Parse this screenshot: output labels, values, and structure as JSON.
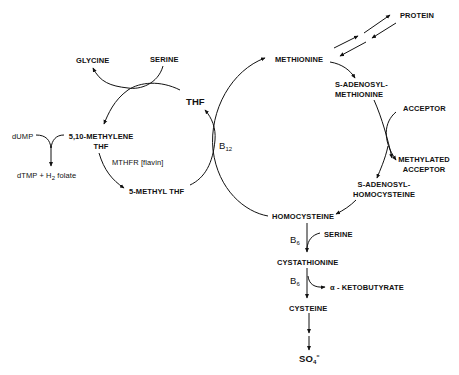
{
  "diagram": {
    "type": "metabolic-pathway",
    "title": "",
    "nodes": {
      "glycine": "GLYCINE",
      "serine_top": "SERINE",
      "thf": "THF",
      "methylene_thf_line1": "5,10-METHYLENE",
      "methylene_thf_line2": "THF",
      "dump": "dUMP",
      "dtmp": "dTMP + H",
      "dtmp_sub": "2",
      "dtmp_tail": " folate",
      "mthfr": "MTHFR [flavin]",
      "methyl_thf": "5-METHYL THF",
      "b12": "B",
      "b12_sub": "12",
      "methionine": "METHIONINE",
      "protein": "PROTEIN",
      "sam_line1": "S-ADENOSYL-",
      "sam_line2": "METHIONINE",
      "acceptor": "ACCEPTOR",
      "methylated_acceptor_line1": "METHYLATED",
      "methylated_acceptor_line2": "ACCEPTOR",
      "sah_line1": "S-ADENOSYL-",
      "sah_line2": "HOMOCYSTEINE",
      "homocysteine": "HOMOCYSTEINE",
      "b6_first": "B",
      "b6_first_sub": "6",
      "serine_bottom": "SERINE",
      "cystathionine": "CYSTATHIONINE",
      "b6_second": "B",
      "b6_second_sub": "6",
      "ketobutyrate": "α - KETOBUTYRATE",
      "cysteine": "CYSTEINE",
      "so4": "SO",
      "so4_sub": "4",
      "so4_sup": "="
    },
    "edges": [
      {
        "from": "SERINE",
        "to": "GLYCINE"
      },
      {
        "from": "THF",
        "to": "5,10-METHYLENE THF"
      },
      {
        "from": "5,10-METHYLENE THF",
        "to": "5-METHYL THF",
        "label": "MTHFR [flavin]"
      },
      {
        "from": "dUMP",
        "to": "dTMP + H2 folate"
      },
      {
        "from": "5-METHYL THF",
        "to": "THF",
        "cofactor": "B12"
      },
      {
        "from": "HOMOCYSTEINE",
        "to": "METHIONINE",
        "cofactor": "B12"
      },
      {
        "from": "METHIONINE",
        "to": "PROTEIN",
        "bidirectional": true
      },
      {
        "from": "METHIONINE",
        "to": "S-ADENOSYL-METHIONINE"
      },
      {
        "from": "S-ADENOSYL-METHIONINE",
        "to": "S-ADENOSYL-HOMOCYSTEINE"
      },
      {
        "from": "ACCEPTOR",
        "to": "METHYLATED ACCEPTOR"
      },
      {
        "from": "S-ADENOSYL-HOMOCYSTEINE",
        "to": "HOMOCYSTEINE"
      },
      {
        "from": "HOMOCYSTEINE",
        "to": "CYSTATHIONINE",
        "cofactor": "B6",
        "co_substrate": "SERINE"
      },
      {
        "from": "CYSTATHIONINE",
        "to": "CYSTEINE",
        "cofactor": "B6",
        "by_product": "α-KETOBUTYRATE"
      },
      {
        "from": "CYSTEINE",
        "to": "SO4="
      }
    ]
  }
}
